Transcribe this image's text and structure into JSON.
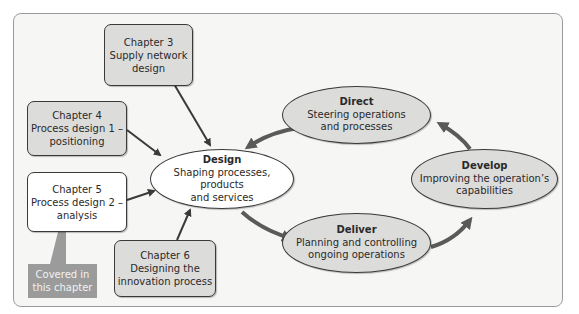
{
  "chapters": [
    {
      "id": "ch3",
      "title": "Chapter 3",
      "line1": "Supply network",
      "line2": "design",
      "style": "grey"
    },
    {
      "id": "ch4",
      "title": "Chapter 4",
      "line1": "Process design 1 –",
      "line2": "positioning",
      "style": "grey"
    },
    {
      "id": "ch5",
      "title": "Chapter 5",
      "line1": "Process design 2 –",
      "line2": "analysis",
      "style": "white"
    },
    {
      "id": "ch6",
      "title": "Chapter 6",
      "line1": "Designing the",
      "line2": "innovation process",
      "style": "grey"
    }
  ],
  "activities": {
    "design": {
      "title": "Design",
      "line1": "Shaping processes, products",
      "line2": "and services"
    },
    "direct": {
      "title": "Direct",
      "line1": "Steering operations",
      "line2": "and processes"
    },
    "develop": {
      "title": "Develop",
      "line1": "Improving the operation’s",
      "line2": "capabilities"
    },
    "deliver": {
      "title": "Deliver",
      "line1": "Planning and controlling",
      "line2": "ongoing operations"
    }
  },
  "callout": {
    "line1": "Covered in",
    "line2": "this chapter"
  },
  "colors": {
    "box_grey": "#dcdcdb",
    "box_white": "#ffffff",
    "frame_bg": "#f6f6f5",
    "arrow": "#3a3a3a",
    "cycle_arrow": "#5a5a5a",
    "callout_bg": "#9b9b9b"
  }
}
